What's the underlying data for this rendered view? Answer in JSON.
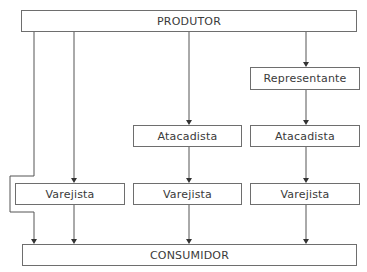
{
  "diagram": {
    "nodes": {
      "produtor": "PRODUTOR",
      "consumidor": "CONSUMIDOR",
      "representante": "Representante",
      "atacadista_3": "Atacadista",
      "atacadista_4": "Atacadista",
      "varejista_2": "Varejista",
      "varejista_3": "Varejista",
      "varejista_4": "Varejista"
    },
    "channels": [
      [
        "PRODUTOR",
        "CONSUMIDOR"
      ],
      [
        "PRODUTOR",
        "Varejista",
        "CONSUMIDOR"
      ],
      [
        "PRODUTOR",
        "Atacadista",
        "Varejista",
        "CONSUMIDOR"
      ],
      [
        "PRODUTOR",
        "Representante",
        "Atacadista",
        "Varejista",
        "CONSUMIDOR"
      ]
    ],
    "colors": {
      "line": "#555555",
      "border": "#6e6e6e",
      "text": "#3a3a3a"
    }
  }
}
